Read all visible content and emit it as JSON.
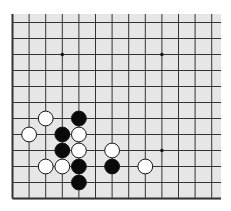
{
  "board": {
    "type": "go-diagram-partial",
    "visible_columns": 13,
    "visible_rows": 12,
    "edges_shown": [
      "left",
      "bottom"
    ],
    "background_color": "#e6e6e6",
    "line_color": "#333333",
    "star_points": [
      {
        "col": 3,
        "row": 2
      },
      {
        "col": 9,
        "row": 2
      },
      {
        "col": 9,
        "row": 8
      }
    ],
    "stones": [
      {
        "color": "white",
        "col": 2,
        "row": 6
      },
      {
        "color": "black",
        "col": 4,
        "row": 6
      },
      {
        "color": "white",
        "col": 1,
        "row": 7
      },
      {
        "color": "black",
        "col": 3,
        "row": 7
      },
      {
        "color": "white",
        "col": 4,
        "row": 7
      },
      {
        "color": "black",
        "col": 3,
        "row": 8
      },
      {
        "color": "white",
        "col": 4,
        "row": 8
      },
      {
        "color": "white",
        "col": 6,
        "row": 8
      },
      {
        "color": "white",
        "col": 2,
        "row": 9
      },
      {
        "color": "white",
        "col": 3,
        "row": 9
      },
      {
        "color": "black",
        "col": 4,
        "row": 9
      },
      {
        "color": "black",
        "col": 6,
        "row": 9
      },
      {
        "color": "white",
        "col": 8,
        "row": 9
      },
      {
        "color": "black",
        "col": 4,
        "row": 10
      }
    ]
  }
}
